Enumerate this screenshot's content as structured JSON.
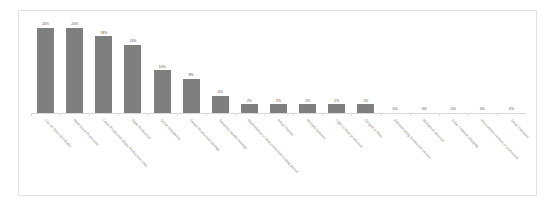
{
  "chart_data": {
    "type": "bar",
    "title": "",
    "subtitle": "",
    "xlabel": "",
    "ylabel": "",
    "ylim": [
      0,
      22
    ],
    "grid": false,
    "legend": false,
    "legend_position": "none",
    "orientation": "vertical",
    "value_suffix": "%",
    "bar_color": "#7f7f7f",
    "label_rotation_deg": 47,
    "categories": [
      "Lite on Time LED Bulbs",
      "New Stock Production",
      "Laser Production (Easy Production Line)",
      "Agile Production",
      "Quick Installation",
      "Tenant Production Savings",
      "Tenant(s) Health Savings",
      "Maintenance or new production tooling period",
      "Asset Tracker",
      "Multiple Sensors",
      "Light to Heat production",
      "On grid or Plus",
      "Administrating production servers",
      "Multiple production",
      "Solar / Vehicle charging",
      "Interconnect version of production",
      "Smart Dimmers"
    ],
    "values": [
      20,
      20,
      18,
      16,
      10,
      8,
      4,
      2,
      2,
      2,
      2,
      2,
      0,
      0,
      0,
      0,
      0
    ],
    "data_labels": [
      "20%",
      "20%",
      "18%",
      "16%",
      "10%",
      "8%",
      "4%",
      "2%",
      "2%",
      "2%",
      "2%",
      "2%",
      "0%",
      "0%",
      "0%",
      "0%",
      "0%"
    ]
  },
  "colors": {
    "bar": "#7f7f7f",
    "border": "#e2e2e2",
    "axis": "#d9d9d9",
    "value_text": "#4a4a4a",
    "category_text": "#808080",
    "background": "#ffffff"
  }
}
